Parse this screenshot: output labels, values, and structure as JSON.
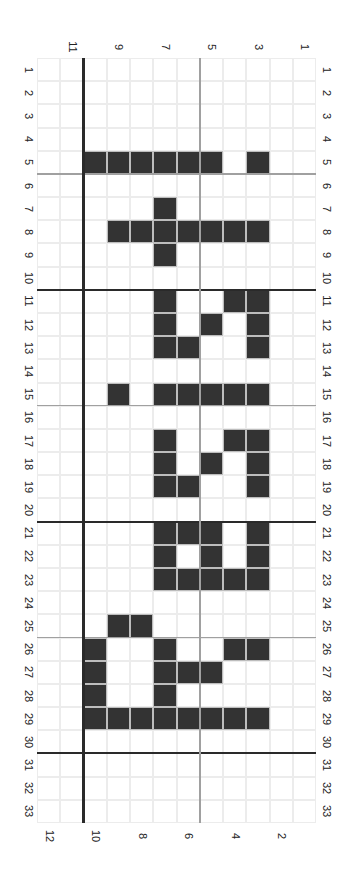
{
  "chart_data": {
    "type": "heatmap",
    "title": "",
    "orientation": "rotated 90deg clockwise",
    "grid": {
      "rows": 33,
      "cols": 12
    },
    "row_labels": [
      "1",
      "2",
      "3",
      "4",
      "5",
      "6",
      "7",
      "8",
      "9",
      "10",
      "11",
      "12",
      "13",
      "14",
      "15",
      "16",
      "17",
      "18",
      "19",
      "20",
      "21",
      "22",
      "23",
      "24",
      "25",
      "26",
      "27",
      "28",
      "29",
      "30",
      "31",
      "32",
      "33"
    ],
    "col_labels_top": [
      "11",
      "9",
      "7",
      "5",
      "3",
      "1"
    ],
    "col_labels_bottom": [
      "12",
      "10",
      "8",
      "6",
      "4",
      "2"
    ],
    "col_order_left_to_right": [
      12,
      11,
      10,
      9,
      8,
      7,
      6,
      5,
      4,
      3,
      2,
      1
    ],
    "filled_cells": {
      "5": [
        10,
        9,
        8,
        7,
        6,
        5,
        3
      ],
      "7": [
        7
      ],
      "8": [
        9,
        8,
        7,
        6,
        5,
        4,
        3
      ],
      "9": [
        7
      ],
      "11": [
        7,
        4,
        3
      ],
      "12": [
        7,
        5,
        3
      ],
      "13": [
        7,
        6,
        3
      ],
      "15": [
        9,
        7,
        6,
        5,
        4,
        3
      ],
      "17": [
        7,
        4,
        3
      ],
      "18": [
        7,
        5,
        3
      ],
      "19": [
        7,
        6,
        3
      ],
      "21": [
        7,
        6,
        5,
        3
      ],
      "22": [
        7,
        5,
        3
      ],
      "23": [
        7,
        6,
        5,
        4,
        3
      ],
      "25": [
        9,
        8
      ],
      "26": [
        10,
        7,
        4,
        3
      ],
      "27": [
        10,
        7,
        6,
        5
      ],
      "28": [
        10,
        7
      ],
      "29": [
        10,
        9,
        8,
        7,
        6,
        5,
        4,
        3
      ]
    },
    "dark_row_separators_after": [
      10,
      20,
      30
    ],
    "gray_row_separators_after": [
      5,
      15,
      25
    ],
    "dark_col_separator_between": [
      11,
      10
    ],
    "gray_col_separator_between": [
      6,
      5
    ]
  },
  "colors": {
    "filled": "#333333",
    "grid": "#ececec",
    "dark_line": "#2a2a2a",
    "gray_line": "#a0a0a0"
  }
}
